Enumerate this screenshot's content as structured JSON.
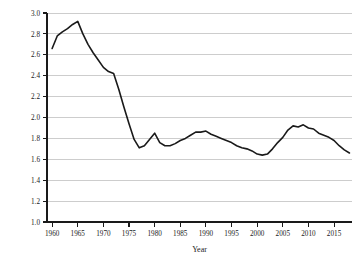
{
  "chart_data": {
    "type": "line",
    "title": "",
    "subtitle": "",
    "xlabel": "Year",
    "ylabel": "",
    "xlim": [
      1959,
      2018.5
    ],
    "ylim": [
      1.0,
      3.0
    ],
    "grid": true,
    "legend_position": "none",
    "x_ticks": [
      1960,
      1965,
      1970,
      1975,
      1980,
      1985,
      1990,
      1995,
      2000,
      2005,
      2010,
      2015
    ],
    "x_tick_labels": [
      "1960",
      "1965",
      "1970",
      "1975",
      "1980",
      "1985",
      "1990",
      "1995",
      "2000",
      "2005",
      "2010",
      "2015"
    ],
    "y_ticks": [
      1.0,
      1.2,
      1.4,
      1.6,
      1.8,
      2.0,
      2.2,
      2.4,
      2.6,
      2.8,
      3.0
    ],
    "y_tick_labels": [
      "1.0",
      "1.2",
      "1.4",
      "1.6",
      "1.8",
      "2.0",
      "2.2",
      "2.4",
      "2.6",
      "2.8",
      "3.0"
    ],
    "line_color": "#1a1a1a",
    "grid_color": "#b8b8b8",
    "series": [
      {
        "name": "Total fertility rate",
        "x": [
          1960,
          1961,
          1962,
          1963,
          1964,
          1965,
          1966,
          1967,
          1968,
          1969,
          1970,
          1971,
          1972,
          1973,
          1974,
          1975,
          1976,
          1977,
          1978,
          1979,
          1980,
          1981,
          1982,
          1983,
          1984,
          1985,
          1986,
          1987,
          1988,
          1989,
          1990,
          1991,
          1992,
          1993,
          1994,
          1995,
          1996,
          1997,
          1998,
          1999,
          2000,
          2001,
          2002,
          2003,
          2004,
          2005,
          2006,
          2007,
          2008,
          2009,
          2010,
          2011,
          2012,
          2013,
          2014,
          2015,
          2016,
          2017,
          2018
        ],
        "y": [
          2.66,
          2.78,
          2.82,
          2.85,
          2.89,
          2.92,
          2.8,
          2.7,
          2.62,
          2.55,
          2.48,
          2.44,
          2.42,
          2.27,
          2.1,
          1.94,
          1.79,
          1.71,
          1.73,
          1.79,
          1.85,
          1.76,
          1.73,
          1.73,
          1.75,
          1.78,
          1.8,
          1.83,
          1.86,
          1.86,
          1.87,
          1.84,
          1.82,
          1.8,
          1.78,
          1.76,
          1.73,
          1.71,
          1.7,
          1.68,
          1.65,
          1.64,
          1.65,
          1.7,
          1.76,
          1.81,
          1.88,
          1.92,
          1.91,
          1.93,
          1.9,
          1.89,
          1.85,
          1.83,
          1.81,
          1.78,
          1.73,
          1.69,
          1.66
        ]
      }
    ]
  }
}
